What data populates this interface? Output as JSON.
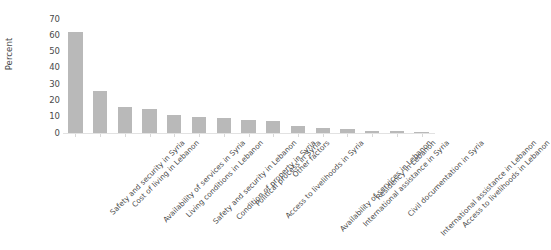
{
  "chart_data": {
    "type": "bar",
    "title": "",
    "subtitle": "",
    "xlabel": "",
    "ylabel": "Percent",
    "ylim": [
      0,
      70
    ],
    "yticks": [
      0,
      10,
      20,
      30,
      40,
      50,
      60,
      70
    ],
    "ytick_labels": [
      "0",
      "10",
      "20",
      "30",
      "40",
      "50",
      "60",
      "70"
    ],
    "grid": false,
    "legend": false,
    "legend_position": "none",
    "bar_color": "#b9b9b9",
    "background_color": "#ffffff",
    "xtick_label_rotation": -45,
    "categories": [
      "Safety and security in Syria",
      "Cost of living in Lebanon",
      "Availability of services in Syria",
      "Living conditions in Lebanon",
      "Safety and security in Lebanon",
      "Condition of property in Syria",
      "Political process in Syria",
      "Access to livelihoods in Syria",
      "Other factors",
      "Availability of services in Lebanon",
      "International assistance in Syria",
      "Residency in Lebanon",
      "Civil documentation in Syria",
      "International assistance in Lebanon",
      "Access to livelihoods in Lebanon"
    ],
    "values": [
      62,
      26,
      16,
      15,
      11,
      10,
      9,
      8,
      7.5,
      4.5,
      3,
      2.5,
      1.2,
      1,
      0.8
    ]
  }
}
